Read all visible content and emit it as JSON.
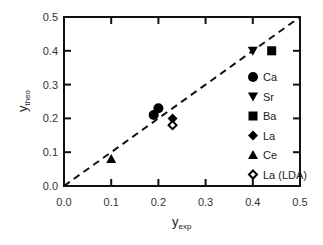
{
  "chart_data": {
    "type": "scatter",
    "title": "",
    "xlabel": "y",
    "xlabel_sub": "exp",
    "ylabel": "y",
    "ylabel_sub": "theo",
    "xlim": [
      0.0,
      0.5
    ],
    "ylim": [
      0.0,
      0.5
    ],
    "grid": false,
    "xticks": [
      "0.0",
      "0.1",
      "0.2",
      "0.3",
      "0.4",
      "0.5"
    ],
    "yticks": [
      "0.0",
      "0.1",
      "0.2",
      "0.3",
      "0.4",
      "0.5"
    ],
    "reference_line": {
      "type": "y=x",
      "style": "dashed",
      "from": [
        0.0,
        0.0
      ],
      "to": [
        0.5,
        0.5
      ]
    },
    "legend_position": "lower right inside",
    "series": [
      {
        "name": "Ca",
        "marker": "filled-circle",
        "points": [
          [
            0.19,
            0.21
          ],
          [
            0.2,
            0.23
          ]
        ]
      },
      {
        "name": "Sr",
        "marker": "filled-triangle-down",
        "points": [
          [
            0.4,
            0.4
          ]
        ]
      },
      {
        "name": "Ba",
        "marker": "filled-square",
        "points": [
          [
            0.44,
            0.4
          ]
        ]
      },
      {
        "name": "La",
        "marker": "filled-diamond",
        "points": [
          [
            0.23,
            0.2
          ]
        ]
      },
      {
        "name": "Ce",
        "marker": "filled-triangle-up",
        "points": [
          [
            0.1,
            0.08
          ]
        ]
      },
      {
        "name": "La (LDA)",
        "marker": "open-diamond",
        "points": [
          [
            0.23,
            0.18
          ]
        ]
      }
    ]
  },
  "legend": {
    "items": [
      "Ca",
      "Sr",
      "Ba",
      "La",
      "Ce",
      "La (LDA)"
    ]
  }
}
